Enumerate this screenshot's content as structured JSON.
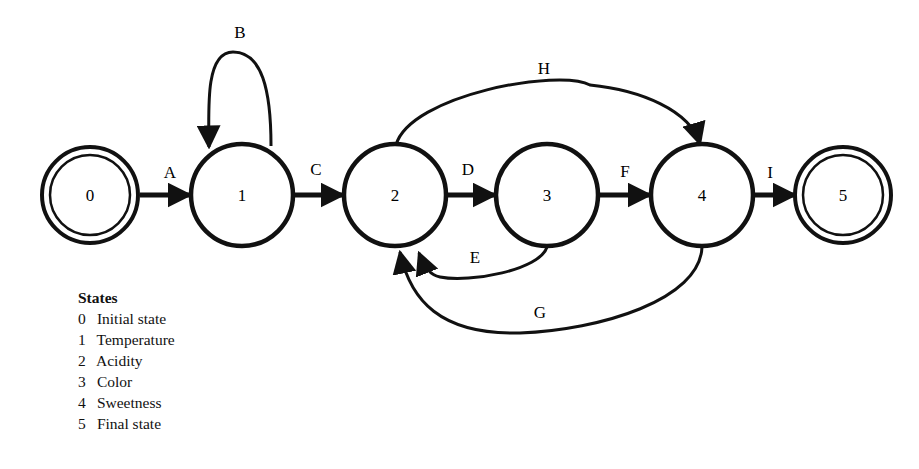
{
  "diagram": {
    "type": "state-transition-diagram",
    "nodes": [
      {
        "id": "0",
        "label": "0",
        "x": 90,
        "y": 195,
        "double": true
      },
      {
        "id": "1",
        "label": "1",
        "x": 242,
        "y": 195,
        "double": false
      },
      {
        "id": "2",
        "label": "2",
        "x": 395,
        "y": 195,
        "double": false
      },
      {
        "id": "3",
        "label": "3",
        "x": 547,
        "y": 195,
        "double": false
      },
      {
        "id": "4",
        "label": "4",
        "x": 702,
        "y": 195,
        "double": false
      },
      {
        "id": "5",
        "label": "5",
        "x": 843,
        "y": 195,
        "double": true
      }
    ],
    "edges": [
      {
        "label": "A",
        "from": "0",
        "to": "1"
      },
      {
        "label": "B",
        "from": "1",
        "to": "1"
      },
      {
        "label": "C",
        "from": "1",
        "to": "2"
      },
      {
        "label": "D",
        "from": "2",
        "to": "3"
      },
      {
        "label": "E",
        "from": "3",
        "to": "2"
      },
      {
        "label": "F",
        "from": "3",
        "to": "4"
      },
      {
        "label": "G",
        "from": "4",
        "to": "2"
      },
      {
        "label": "H",
        "from": "2",
        "to": "4"
      },
      {
        "label": "I",
        "from": "4",
        "to": "5"
      }
    ]
  },
  "legend": {
    "title": "States",
    "items": [
      {
        "num": "0",
        "name": "Initial state"
      },
      {
        "num": "1",
        "name": "Temperature"
      },
      {
        "num": "2",
        "name": "Acidity"
      },
      {
        "num": "3",
        "name": "Color"
      },
      {
        "num": "4",
        "name": "Sweetness"
      },
      {
        "num": "5",
        "name": "Final state"
      }
    ]
  }
}
